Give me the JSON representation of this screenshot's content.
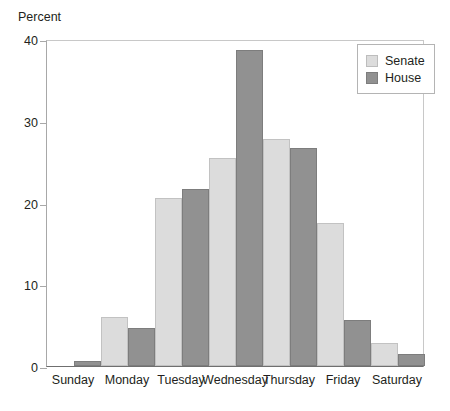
{
  "chart_data": {
    "type": "bar",
    "title": "",
    "xlabel": "",
    "ylabel": "Percent",
    "ylim": [
      0,
      40
    ],
    "yticks": [
      0,
      10,
      20,
      30,
      40
    ],
    "grid": false,
    "legend_position": "top-right",
    "categories": [
      "Sunday",
      "Monday",
      "Tuesday",
      "Wednesday",
      "Thursday",
      "Friday",
      "Saturday"
    ],
    "series": [
      {
        "name": "Senate",
        "color": "#dcdcdc",
        "values": [
          0,
          6.0,
          20.6,
          25.5,
          27.8,
          17.5,
          2.8
        ]
      },
      {
        "name": "House",
        "color": "#919191",
        "values": [
          0.6,
          4.6,
          21.6,
          38.6,
          26.7,
          5.6,
          1.5
        ]
      }
    ]
  },
  "axis": {
    "y_title": "Percent",
    "y_tick_labels": [
      "40",
      "30",
      "20",
      "10",
      "0"
    ],
    "x_tick_labels": [
      "Sunday",
      "Monday",
      "Tuesday",
      "Wednesday",
      "Thursday",
      "Friday",
      "Saturday"
    ]
  },
  "legend": {
    "entries": [
      {
        "label": "Senate"
      },
      {
        "label": "House"
      }
    ]
  }
}
